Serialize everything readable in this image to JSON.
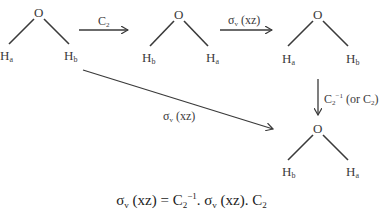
{
  "diagram": {
    "molecules": [
      {
        "id": "m1",
        "center": "O",
        "left": {
          "sym": "H",
          "sub": "a"
        },
        "right": {
          "sym": "H",
          "sub": "b"
        }
      },
      {
        "id": "m2",
        "center": "O",
        "left": {
          "sym": "H",
          "sub": "b"
        },
        "right": {
          "sym": "H",
          "sub": "a"
        }
      },
      {
        "id": "m3",
        "center": "O",
        "left": {
          "sym": "H",
          "sub": "a"
        },
        "right": {
          "sym": "H",
          "sub": "b"
        }
      },
      {
        "id": "m4",
        "center": "O",
        "left": {
          "sym": "H",
          "sub": "b"
        },
        "right": {
          "sym": "H",
          "sub": "a"
        }
      }
    ],
    "arrows": [
      {
        "id": "a1",
        "from": "m1",
        "to": "m2",
        "label": {
          "main": "C",
          "sub": "2"
        }
      },
      {
        "id": "a2",
        "from": "m2",
        "to": "m3",
        "label": {
          "main": "σ",
          "sub": "v",
          "rest": " (xz)"
        }
      },
      {
        "id": "a3",
        "from": "m3",
        "to": "m4",
        "label": {
          "main": "C",
          "sub": "2",
          "sup": "−1",
          "rest": " (or C",
          "sub2": "2",
          "end": ")"
        }
      },
      {
        "id": "a4",
        "from": "m1",
        "to": "m4",
        "label": {
          "main": "σ",
          "sub": "v",
          "rest": " (xz)"
        }
      }
    ],
    "equation": {
      "lhs_main": "σ",
      "lhs_sub": "v",
      "lhs_rest": " (xz) = C",
      "t1_sub": "2",
      "t1_sup": "−1",
      "t1_rest": ". σ",
      "t2_sub": "v",
      "t2_rest": " (xz). C",
      "t3_sub": "2"
    },
    "colors": {
      "ink": "#3a3a3a",
      "background": "#ffffff"
    }
  }
}
